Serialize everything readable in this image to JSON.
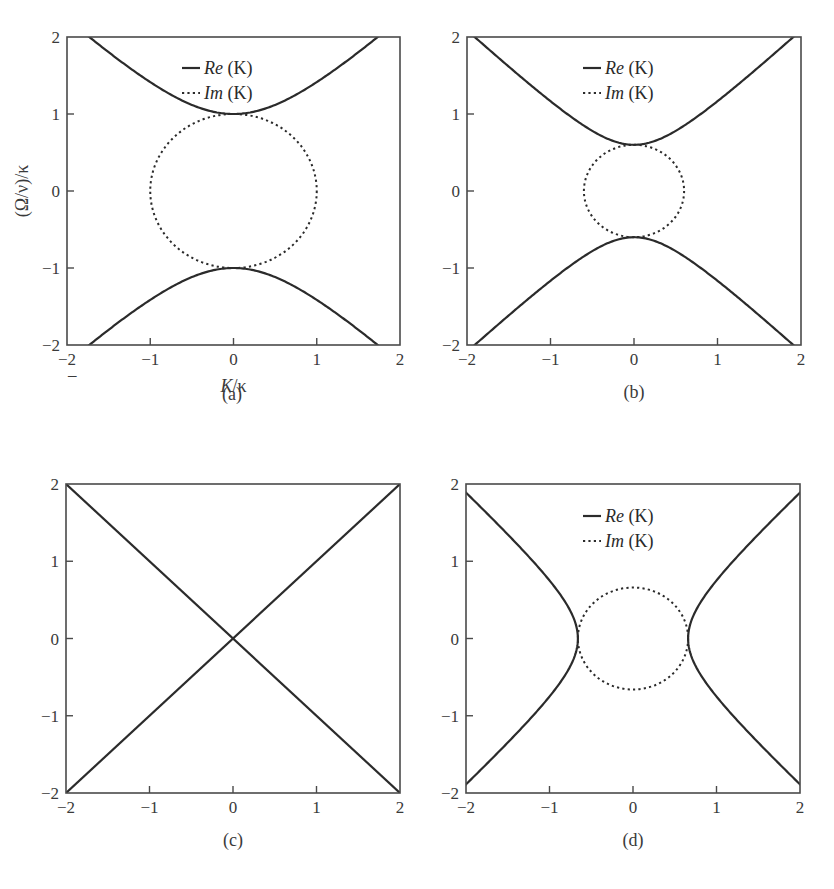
{
  "figure": {
    "y_axis_title": "(Ω/ν)/κ",
    "x_axis_title": "K/κ",
    "stray_mark": "–"
  },
  "chart_data": [
    {
      "id": "a",
      "type": "line",
      "panel_label": "(a)",
      "xlabel": "K/κ",
      "ylabel": "(Ω/ν)/κ",
      "xlim": [
        -2,
        2
      ],
      "ylim": [
        -2,
        2
      ],
      "xticks": [
        "−2",
        "−1",
        "0",
        "1",
        "2"
      ],
      "yticks": [
        "2",
        "1",
        "0",
        "−1",
        "−2"
      ],
      "grid": false,
      "legend": [
        {
          "name": "Re",
          "suffix": " (K)",
          "style": "solid"
        },
        {
          "name": "Im",
          "suffix": " (K)",
          "style": "dotted"
        }
      ],
      "series": [
        {
          "name": "Re (K)",
          "style": "solid",
          "form": "vertical-hyperbola",
          "gap": 1.0,
          "description": "Ω = ±sqrt(K² + 1)",
          "points_upper": [
            [
              -1.73,
              2
            ],
            [
              -1,
              1.41
            ],
            [
              0,
              1
            ],
            [
              1,
              1.41
            ],
            [
              1.73,
              2
            ]
          ]
        },
        {
          "name": "Im (K)",
          "style": "dotted",
          "form": "circle",
          "radius": 1.0,
          "description": "K² + Ω² = 1"
        }
      ]
    },
    {
      "id": "b",
      "type": "line",
      "panel_label": "(b)",
      "xlabel": "",
      "ylabel": "",
      "xlim": [
        -2,
        2
      ],
      "ylim": [
        -2,
        2
      ],
      "xticks": [
        "−2",
        "−1",
        "0",
        "1",
        "2"
      ],
      "yticks": [
        "2",
        "1",
        "0",
        "−1",
        "−2"
      ],
      "grid": false,
      "legend": [
        {
          "name": "Re",
          "suffix": " (K)",
          "style": "solid"
        },
        {
          "name": "Im",
          "suffix": " (K)",
          "style": "dotted"
        }
      ],
      "series": [
        {
          "name": "Re (K)",
          "style": "solid",
          "form": "vertical-hyperbola",
          "gap": 0.6,
          "description": "Ω = ±sqrt(K² + 0.36)",
          "points_upper": [
            [
              -1.91,
              2
            ],
            [
              -1,
              1.17
            ],
            [
              0,
              0.6
            ],
            [
              1,
              1.17
            ],
            [
              1.91,
              2
            ]
          ]
        },
        {
          "name": "Im (K)",
          "style": "dotted",
          "form": "circle",
          "radius": 0.6,
          "description": "K² + Ω² = 0.36"
        }
      ]
    },
    {
      "id": "c",
      "type": "line",
      "panel_label": "(c)",
      "xlabel": "",
      "ylabel": "",
      "xlim": [
        -2,
        2
      ],
      "ylim": [
        -2,
        2
      ],
      "xticks": [
        "−2",
        "−1",
        "0",
        "1",
        "2"
      ],
      "yticks": [
        "2",
        "1",
        "0",
        "−1",
        "−2"
      ],
      "grid": false,
      "legend": [],
      "series": [
        {
          "name": "Re (K)",
          "style": "solid",
          "form": "lines",
          "description": "Ω = ±K",
          "points": [
            [
              -2,
              -2
            ],
            [
              2,
              2
            ]
          ],
          "points2": [
            [
              -2,
              2
            ],
            [
              2,
              -2
            ]
          ]
        }
      ]
    },
    {
      "id": "d",
      "type": "line",
      "panel_label": "(d)",
      "xlabel": "",
      "ylabel": "",
      "xlim": [
        -2,
        2
      ],
      "ylim": [
        -2,
        2
      ],
      "xticks": [
        "−2",
        "−1",
        "0",
        "1",
        "2"
      ],
      "yticks": [
        "2",
        "1",
        "0",
        "−1",
        "−2"
      ],
      "grid": false,
      "legend": [
        {
          "name": "Re",
          "suffix": " (K)",
          "style": "solid"
        },
        {
          "name": "Im",
          "suffix": " (K)",
          "style": "dotted"
        }
      ],
      "series": [
        {
          "name": "Re (K)",
          "style": "solid",
          "form": "horizontal-hyperbola",
          "gap": 0.66,
          "description": "Ω = ±sqrt(K² − 0.44), |K| ≥ 0.66",
          "points_right": [
            [
              0.66,
              0
            ],
            [
              1,
              0.75
            ],
            [
              1.5,
              1.35
            ],
            [
              2,
              1.88
            ]
          ]
        },
        {
          "name": "Im (K)",
          "style": "dotted",
          "form": "circle",
          "radius": 0.66,
          "description": "K² + Ω² = 0.44"
        }
      ]
    }
  ],
  "layout": {
    "panels": [
      {
        "x0": 67,
        "x1": 400,
        "y0": 37,
        "y1": 345,
        "label_x": 232,
        "label_y": 400,
        "legend_x": 182,
        "legend_y": 68,
        "show_ylabel": true,
        "show_xlabel": true
      },
      {
        "x0": 467,
        "x1": 801,
        "y0": 37,
        "y1": 345,
        "label_x": 634,
        "label_y": 398,
        "legend_x": 583,
        "legend_y": 68,
        "show_ylabel": false,
        "show_xlabel": false
      },
      {
        "x0": 66,
        "x1": 400,
        "y0": 484,
        "y1": 793,
        "label_x": 233,
        "label_y": 846,
        "legend_x": 0,
        "legend_y": 0,
        "show_ylabel": false,
        "show_xlabel": false
      },
      {
        "x0": 466,
        "x1": 800,
        "y0": 484,
        "y1": 793,
        "label_x": 633,
        "label_y": 846,
        "legend_x": 583,
        "legend_y": 516,
        "show_ylabel": false,
        "show_xlabel": false
      }
    ]
  }
}
